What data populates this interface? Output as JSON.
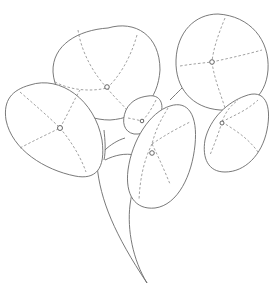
{
  "image": {
    "subject": "pencil sketch of pilea (Chinese money plant) leaves",
    "background": "#ffffff",
    "line_color": "#6a6a6a",
    "leaves": [
      {
        "name": "top-left-leaf"
      },
      {
        "name": "top-right-leaf"
      },
      {
        "name": "left-leaf"
      },
      {
        "name": "small-center-leaf"
      },
      {
        "name": "center-leaf"
      },
      {
        "name": "right-leaf"
      }
    ]
  }
}
